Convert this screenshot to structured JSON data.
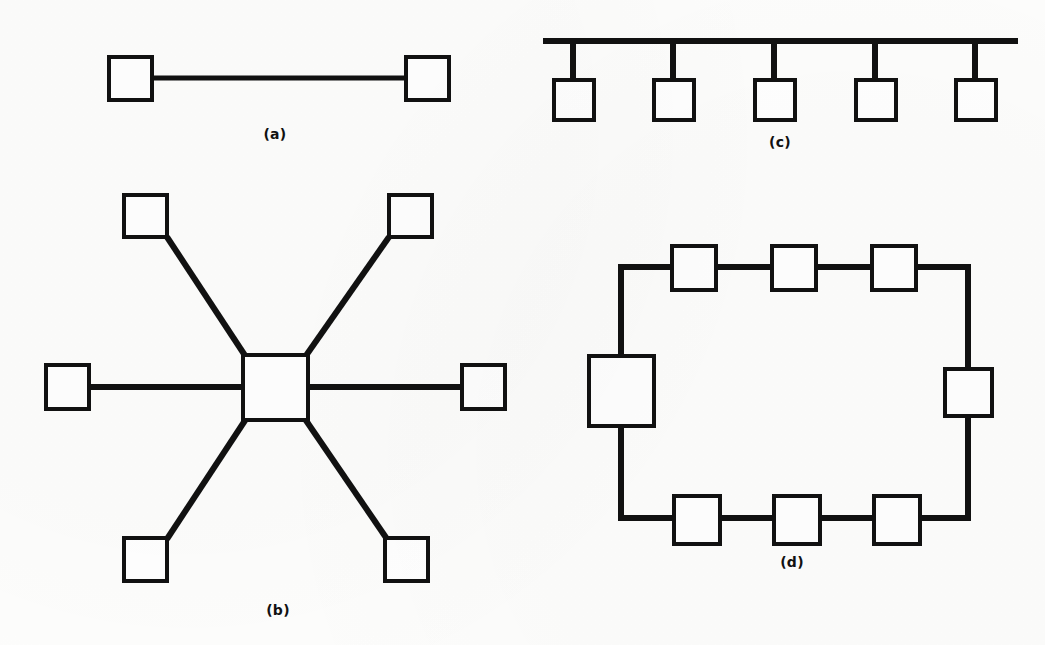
{
  "figure": {
    "background_color": "#fdfdfc",
    "ink_color": "#111111",
    "panel_labels": {
      "a": "(a)",
      "b": "(b)",
      "c": "(c)",
      "d": "(d)"
    }
  },
  "panels": {
    "a": {
      "label": "(a)",
      "topology": "point-to-point",
      "node_count": 2,
      "link_count": 1,
      "label_x": 275,
      "label_y": 128,
      "nodes": [
        {
          "name": "node-left",
          "x": 107,
          "y": 55,
          "w": 46,
          "h": 46
        },
        {
          "name": "node-right",
          "x": 405,
          "y": 55,
          "w": 46,
          "h": 46
        }
      ],
      "links": [
        {
          "name": "link-horizontal",
          "x1": 153,
          "y1": 78,
          "x2": 405,
          "y2": 78,
          "width": 5
        }
      ]
    },
    "b": {
      "label": "(b)",
      "topology": "star",
      "node_count": 7,
      "link_count": 6,
      "label_x": 278,
      "label_y": 602,
      "hub": {
        "name": "hub-node",
        "x": 242,
        "y": 355,
        "w": 66,
        "h": 66,
        "stroke": 4
      },
      "nodes": [
        {
          "name": "node-upper-left",
          "x": 124,
          "y": 195,
          "w": 45,
          "h": 44
        },
        {
          "name": "node-upper-right",
          "x": 387,
          "y": 195,
          "w": 45,
          "h": 44
        },
        {
          "name": "node-left",
          "x": 45,
          "y": 364,
          "w": 45,
          "h": 45
        },
        {
          "name": "node-right",
          "x": 461,
          "y": 364,
          "w": 45,
          "h": 45
        },
        {
          "name": "node-lower-left",
          "x": 124,
          "y": 537,
          "w": 45,
          "h": 45
        },
        {
          "name": "node-lower-right",
          "x": 385,
          "y": 537,
          "w": 45,
          "h": 45
        }
      ],
      "links": [
        {
          "name": "spoke-upper-left",
          "x1": 169,
          "y1": 239,
          "x2": 244,
          "y2": 356,
          "width": 6
        },
        {
          "name": "spoke-upper-right",
          "x1": 387,
          "y1": 239,
          "x2": 307,
          "y2": 356,
          "width": 6
        },
        {
          "name": "spoke-left",
          "x1": 90,
          "y1": 387,
          "x2": 242,
          "y2": 387,
          "width": 6
        },
        {
          "name": "spoke-right",
          "x1": 308,
          "y1": 387,
          "x2": 461,
          "y2": 387,
          "width": 6
        },
        {
          "name": "spoke-lower-left",
          "x1": 169,
          "y1": 537,
          "x2": 244,
          "y2": 421,
          "width": 6
        },
        {
          "name": "spoke-lower-right",
          "x1": 385,
          "y1": 537,
          "x2": 306,
          "y2": 421,
          "width": 6
        }
      ]
    },
    "c": {
      "label": "(c)",
      "topology": "bus",
      "node_count": 5,
      "link_count": 5,
      "label_x": 780,
      "label_y": 136,
      "backbone": {
        "name": "bus-backbone",
        "x1": 543,
        "y1": 41,
        "x2": 1018,
        "y2": 41,
        "width": 6
      },
      "nodes": [
        {
          "name": "node-1",
          "x": 555,
          "y": 78,
          "w": 42,
          "h": 42
        },
        {
          "name": "node-2",
          "x": 655,
          "y": 78,
          "w": 42,
          "h": 42
        },
        {
          "name": "node-3",
          "x": 756,
          "y": 78,
          "w": 42,
          "h": 42
        },
        {
          "name": "node-4",
          "x": 857,
          "y": 78,
          "w": 42,
          "h": 42
        },
        {
          "name": "node-5",
          "x": 957,
          "y": 78,
          "w": 42,
          "h": 42
        }
      ],
      "links": [
        {
          "name": "drop-1",
          "x1": 573,
          "y1": 41,
          "x2": 573,
          "y2": 80,
          "width": 6
        },
        {
          "name": "drop-2",
          "x1": 673,
          "y1": 41,
          "x2": 673,
          "y2": 80,
          "width": 6
        },
        {
          "name": "drop-3",
          "x1": 774,
          "y1": 41,
          "x2": 774,
          "y2": 80,
          "width": 6
        },
        {
          "name": "drop-4",
          "x1": 875,
          "y1": 41,
          "x2": 875,
          "y2": 80,
          "width": 6
        },
        {
          "name": "drop-5",
          "x1": 975,
          "y1": 41,
          "x2": 975,
          "y2": 80,
          "width": 6
        }
      ]
    },
    "d": {
      "label": "(d)",
      "topology": "ring",
      "node_count": 8,
      "link_count": 8,
      "label_x": 792,
      "label_y": 554,
      "ring_path": {
        "name": "ring-loop",
        "left_x": 621,
        "right_x": 968,
        "top_y": 267,
        "bottom_y": 518,
        "width": 6
      },
      "nodes": [
        {
          "name": "node-top-1",
          "x": 672,
          "y": 246,
          "w": 44,
          "h": 44
        },
        {
          "name": "node-top-2",
          "x": 772,
          "y": 246,
          "w": 44,
          "h": 44
        },
        {
          "name": "node-top-3",
          "x": 872,
          "y": 246,
          "w": 44,
          "h": 44
        },
        {
          "name": "node-left",
          "x": 589,
          "y": 356,
          "w": 66,
          "h": 70
        },
        {
          "name": "node-right",
          "x": 945,
          "y": 369,
          "w": 47,
          "h": 47
        },
        {
          "name": "node-bottom-1",
          "x": 674,
          "y": 496,
          "w": 46,
          "h": 48
        },
        {
          "name": "node-bottom-2",
          "x": 774,
          "y": 496,
          "w": 46,
          "h": 48
        },
        {
          "name": "node-bottom-3",
          "x": 874,
          "y": 496,
          "w": 46,
          "h": 48
        }
      ]
    }
  }
}
